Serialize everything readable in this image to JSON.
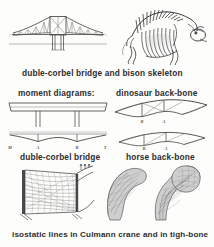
{
  "plate": {
    "title": "Structural analogies between engineering works and skeletons",
    "background_color": "#fdfdfc",
    "ink_color": "#3a3a3a",
    "caption_color": "#2d2d2d"
  },
  "captions": {
    "row1": "duble-corbel bridge and bison skeleton",
    "row2_left": "moment diagrams:",
    "row2_right": "dinosaur back-bone",
    "row3_left": "duble-corbel bridge",
    "row3_right": "horse back-bone",
    "row4": "isostatic lines in Culmann crane and in tigh-bone"
  },
  "figures": [
    {
      "id": "cantilever-bridge",
      "name": "duble-corbel bridge",
      "type": "line-drawing",
      "description": "Double-cantilever (corbel) truss bridge in elevation with central suspended span, two piers and a horizon line"
    },
    {
      "id": "bison-skeleton",
      "name": "bison skeleton",
      "type": "engraving",
      "description": "Articulated bison skeleton in right-facing lateral view, dorsal spines forming a cantilever over the forelimbs"
    },
    {
      "id": "moment-diagram-beam",
      "name": "continuous beam loading diagram",
      "type": "line-drawing",
      "description": "Continuous beam deck supported on two interior piers"
    },
    {
      "id": "moment-diagram-curve",
      "name": "bending moment diagram",
      "type": "line-drawing",
      "description": "Bending moment curve for the double-cantilever bridge, hogging over supports and sagging in the spans"
    },
    {
      "id": "dinosaur-backbone",
      "name": "dinosaur back-bone",
      "type": "line-drawing",
      "description": "Dinosaur vertebral column drawn as a tensioned truss between two limb supports"
    },
    {
      "id": "horse-backbone",
      "name": "horse back-bone",
      "type": "line-drawing",
      "description": "Horse vertebral column drawn as a bowstring truss between fore and hind limb supports"
    },
    {
      "id": "culmann-crane",
      "name": "Culmann crane",
      "type": "line-drawing",
      "description": "Culmann crane hook section with the network of principal stress (isostatic) trajectories"
    },
    {
      "id": "tigh-bone",
      "name": "tigh-bone",
      "type": "halftone",
      "description": "Two sections of the proximal femur showing trabecular bone aligned with the isostatic lines"
    }
  ],
  "node_labels": {
    "moment_curve": [
      "M",
      "A",
      "B",
      "T"
    ],
    "dinosaur": [
      "B",
      "A"
    ],
    "horse": [
      "B",
      "A"
    ]
  }
}
